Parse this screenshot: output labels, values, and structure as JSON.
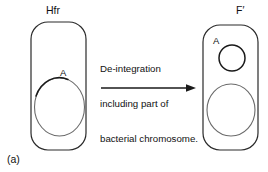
{
  "figure": {
    "caption": "(a)",
    "left_cell": {
      "label": "Hfr",
      "marker_label": "A"
    },
    "right_cell": {
      "label": "F′",
      "marker_label": "A"
    },
    "process": {
      "line1": "De-integration",
      "line2": "including part of",
      "line3": "bacterial chromosome.",
      "arrow": "rightwards-arrow"
    },
    "colors": {
      "stroke": "#1a1a1a",
      "stroke_light": "#5a5a5a",
      "background": "#ffffff",
      "text": "#111111"
    }
  }
}
